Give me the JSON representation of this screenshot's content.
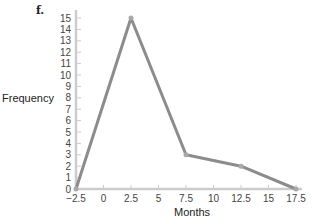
{
  "chart_data": {
    "type": "line",
    "panel_label": "f.",
    "title": "",
    "xlabel": "Months",
    "ylabel": "Frequency",
    "x": [
      -2.5,
      2.5,
      7.5,
      12.5,
      17.5
    ],
    "series": [
      {
        "name": "Frequency",
        "values": [
          0,
          15,
          3,
          2,
          0
        ]
      }
    ],
    "x_ticks": [
      -2.5,
      0,
      2.5,
      5,
      7.5,
      10,
      12.5,
      15,
      17.5
    ],
    "x_tick_labels": [
      "−2.5",
      "0",
      "2.5",
      "5",
      "7.5",
      "10",
      "12.5",
      "15",
      "17.5"
    ],
    "y_ticks": [
      0,
      1,
      2,
      3,
      4,
      5,
      6,
      7,
      8,
      9,
      10,
      11,
      12,
      13,
      14,
      15
    ],
    "xlim": [
      -2.5,
      17.5
    ],
    "ylim": [
      0,
      15
    ],
    "grid": false,
    "legend": "none",
    "line_color": "#8c8c8c",
    "axis_color": "#cccccc"
  }
}
